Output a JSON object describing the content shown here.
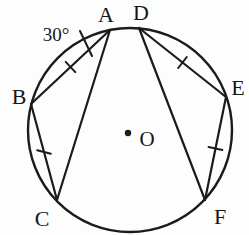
{
  "diagram": {
    "type": "circle-geometry-figure",
    "background_color": "#fdfdfd",
    "line_color": "#1b1b1b",
    "points": {
      "a": "A",
      "b": "B",
      "c": "C",
      "d": "D",
      "e": "E",
      "f": "F"
    },
    "center": {
      "label": "O"
    },
    "angle": {
      "label": "30°",
      "value_degrees": 30,
      "at_point": "A"
    },
    "chords": [
      "AB",
      "BC",
      "AC",
      "DE",
      "EF",
      "DF"
    ],
    "equal_chord_ticks": [
      "AB",
      "BC",
      "DE",
      "EF"
    ]
  }
}
